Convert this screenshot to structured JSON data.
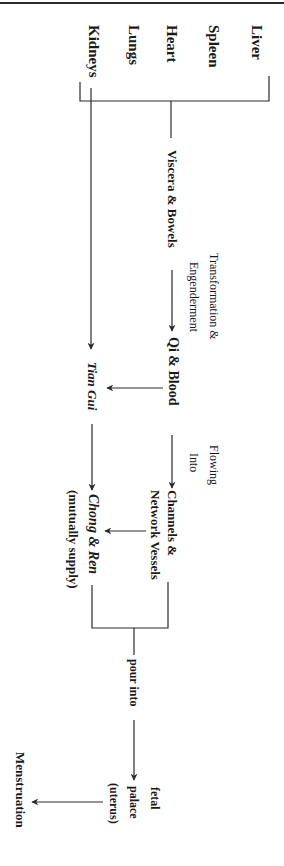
{
  "diagram": {
    "orientation": "rotated 90deg clockwise (text reads top-to-bottom)",
    "colors": {
      "line": "#2a2a2a",
      "text": "#1a1a1a",
      "background": "#ffffff"
    },
    "organs": [
      {
        "id": "liver",
        "label": "Liver"
      },
      {
        "id": "spleen",
        "label": "Spleen"
      },
      {
        "id": "heart",
        "label": "Heart"
      },
      {
        "id": "lungs",
        "label": "Lungs"
      },
      {
        "id": "kidneys",
        "label": "Kidneys"
      }
    ],
    "nodes": {
      "viscera_bowels": "Viscera & Bowels",
      "qi_blood": "Qi & Blood",
      "tian_gui": "Tian Gui",
      "channels_line1": "Channels &",
      "channels_line2": "Network Vessels",
      "chong_ren": "Chong & Ren",
      "chong_ren_note": "(mutually supply)",
      "fetal": "fetal",
      "palace": "palace",
      "uterus": "(uterus)",
      "menstruation": "Menstruation"
    },
    "edge_labels": {
      "transformation_line1": "Transformation &",
      "transformation_line2": "Engenderment",
      "flowing_line1": "Flowing",
      "flowing_line2": "Into",
      "pour_into": "pour into"
    },
    "edges": [
      {
        "from": "organs",
        "to": "viscera_bowels",
        "type": "bracket"
      },
      {
        "from": "kidneys",
        "to": "tian_gui",
        "type": "arrow"
      },
      {
        "from": "viscera_bowels",
        "to": "qi_blood",
        "label": "Transformation & Engenderment"
      },
      {
        "from": "qi_blood",
        "to": "tian_gui",
        "type": "arrow"
      },
      {
        "from": "qi_blood",
        "to": "channels_network_vessels",
        "label": "Flowing Into"
      },
      {
        "from": "tian_gui",
        "to": "chong_ren",
        "type": "arrow"
      },
      {
        "from": "channels_network_vessels",
        "to": "chong_ren",
        "type": "arrow"
      },
      {
        "from": "chong_ren_and_channels",
        "to": "fetal_palace",
        "label": "pour into",
        "type": "bracket-arrow"
      },
      {
        "from": "fetal_palace",
        "to": "menstruation",
        "type": "arrow"
      }
    ]
  }
}
